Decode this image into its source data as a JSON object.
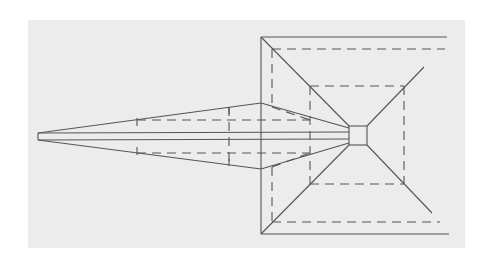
{
  "diagram": {
    "type": "perspective line drawing",
    "colors": {
      "background": "#ffffff",
      "panel": "#ececec",
      "line": "#555555"
    },
    "elements": {
      "wedge": "long tapered solid wedge with apex at left",
      "center_square": "small solid square at convergence point",
      "outer_frame": "solid open rectangle on right (top, left, bottom edges)",
      "dashed_frame": "dashed inner rectangle on right",
      "inner_square": "dashed square around central square",
      "diagonals": "four solid diagonals radiating from central square corners"
    }
  }
}
